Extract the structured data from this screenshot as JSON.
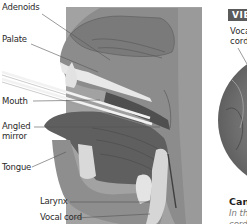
{
  "diagram": {
    "labels": {
      "adenoids": "Adenoids",
      "palate": "Palate",
      "mouth": "Mouth",
      "angled_mirror_line1": "Angled",
      "angled_mirror_line2": "mirror",
      "tongue": "Tongue",
      "larynx": "Larynx",
      "vocal_cord": "Vocal cord"
    },
    "colors": {
      "panel": "#9b9b9b",
      "head_dark": "#6f6f6f",
      "head_mid": "#8a8a8a",
      "tongue": "#5e5e5e",
      "highlight": "#e6e6e6",
      "leader": "#555555"
    }
  },
  "view_panel": {
    "badge": "VIEW",
    "vocal_cord_label": "Vocal cord",
    "caption_title": "Cancer",
    "caption_text_line1": "In this",
    "caption_text_line2": "cord is"
  }
}
